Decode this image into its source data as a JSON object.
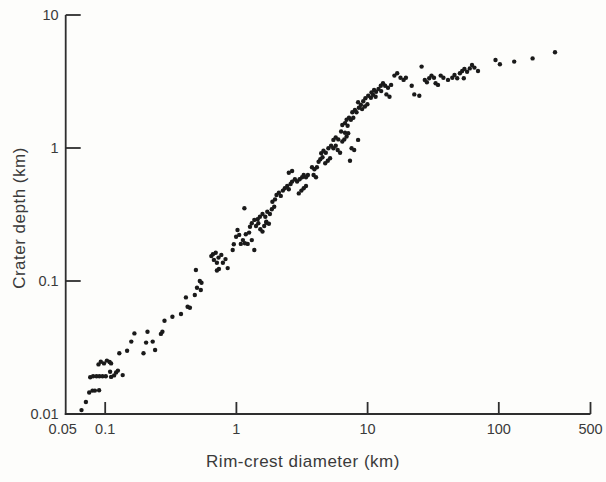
{
  "chart_data": {
    "type": "scatter",
    "title": "",
    "xlabel": "Rim-crest diameter (km)",
    "ylabel": "Crater depth (km)",
    "x_scale": "log",
    "y_scale": "log",
    "xlim": [
      0.05,
      500
    ],
    "ylim": [
      0.01,
      10
    ],
    "grid": false,
    "legend": null,
    "axis_color": "#2e2e2e",
    "label_color": "#3a3a3a",
    "x_ticks": [
      0.1,
      1,
      10,
      100,
      500
    ],
    "x_tick_labels": [
      "0.1",
      "1",
      "10",
      "100",
      "500"
    ],
    "x_edge_label": "0.05",
    "y_ticks": [
      10,
      1,
      0.1,
      0.01
    ],
    "y_tick_labels": [
      "10",
      "1",
      "0.1",
      "0.01"
    ],
    "marker": {
      "shape": "circle",
      "color": "#1a1a1a",
      "radius_px": 2.2
    },
    "points": [
      [
        0.066,
        0.0107
      ],
      [
        0.0713,
        0.0123
      ],
      [
        0.0755,
        0.0145
      ],
      [
        0.08,
        0.015
      ],
      [
        0.0834,
        0.015
      ],
      [
        0.0898,
        0.0151
      ],
      [
        0.0768,
        0.0189
      ],
      [
        0.0809,
        0.0192
      ],
      [
        0.0859,
        0.0192
      ],
      [
        0.0904,
        0.0192
      ],
      [
        0.0953,
        0.0192
      ],
      [
        0.101,
        0.0192
      ],
      [
        0.0889,
        0.0236
      ],
      [
        0.0925,
        0.0247
      ],
      [
        0.0979,
        0.024
      ],
      [
        0.103,
        0.0252
      ],
      [
        0.108,
        0.0246
      ],
      [
        0.111,
        0.024
      ],
      [
        0.109,
        0.0208
      ],
      [
        0.111,
        0.019
      ],
      [
        0.117,
        0.0195
      ],
      [
        0.121,
        0.0205
      ],
      [
        0.125,
        0.0212
      ],
      [
        0.136,
        0.0196
      ],
      [
        0.128,
        0.0286
      ],
      [
        0.147,
        0.0299
      ],
      [
        0.158,
        0.035
      ],
      [
        0.167,
        0.0404
      ],
      [
        0.196,
        0.0286
      ],
      [
        0.205,
        0.0344
      ],
      [
        0.21,
        0.0416
      ],
      [
        0.23,
        0.035
      ],
      [
        0.24,
        0.0303
      ],
      [
        0.266,
        0.04
      ],
      [
        0.273,
        0.0416
      ],
      [
        0.283,
        0.0503
      ],
      [
        0.325,
        0.0539
      ],
      [
        0.378,
        0.0565
      ],
      [
        0.425,
        0.0641
      ],
      [
        0.412,
        0.0753
      ],
      [
        0.442,
        0.063
      ],
      [
        0.482,
        0.0785
      ],
      [
        0.501,
        0.0891
      ],
      [
        0.526,
        0.1
      ],
      [
        0.542,
        0.0971
      ],
      [
        0.535,
        0.0855
      ],
      [
        0.491,
        0.121
      ],
      [
        0.644,
        0.154
      ],
      [
        0.662,
        0.159
      ],
      [
        0.695,
        0.163
      ],
      [
        0.674,
        0.144
      ],
      [
        0.71,
        0.137
      ],
      [
        0.731,
        0.15
      ],
      [
        0.767,
        0.157
      ],
      [
        0.735,
        0.123
      ],
      [
        0.71,
        0.12
      ],
      [
        0.789,
        0.137
      ],
      [
        0.826,
        0.146
      ],
      [
        0.859,
        0.125
      ],
      [
        0.938,
        0.171
      ],
      [
        0.955,
        0.189
      ],
      [
        0.995,
        0.215
      ],
      [
        1.02,
        0.242
      ],
      [
        1.05,
        0.222
      ],
      [
        1.08,
        0.19
      ],
      [
        1.12,
        0.203
      ],
      [
        1.16,
        0.192
      ],
      [
        1.18,
        0.225
      ],
      [
        1.22,
        0.19
      ],
      [
        1.25,
        0.231
      ],
      [
        1.27,
        0.256
      ],
      [
        1.31,
        0.272
      ],
      [
        1.37,
        0.288
      ],
      [
        1.41,
        0.259
      ],
      [
        1.47,
        0.272
      ],
      [
        1.52,
        0.245
      ],
      [
        1.58,
        0.235
      ],
      [
        1.63,
        0.259
      ],
      [
        1.69,
        0.274
      ],
      [
        1.31,
        0.203
      ],
      [
        1.37,
        0.171
      ],
      [
        1.15,
        0.352
      ],
      [
        1.45,
        0.291
      ],
      [
        1.51,
        0.304
      ],
      [
        1.58,
        0.319
      ],
      [
        1.66,
        0.304
      ],
      [
        1.72,
        0.332
      ],
      [
        1.8,
        0.319
      ],
      [
        1.86,
        0.346
      ],
      [
        1.94,
        0.362
      ],
      [
        1.69,
        0.279
      ],
      [
        1.77,
        0.269
      ],
      [
        1.88,
        0.395
      ],
      [
        1.97,
        0.411
      ],
      [
        2.02,
        0.443
      ],
      [
        2.11,
        0.461
      ],
      [
        2.18,
        0.436
      ],
      [
        2.26,
        0.478
      ],
      [
        2.34,
        0.498
      ],
      [
        2.44,
        0.518
      ],
      [
        2.51,
        0.489
      ],
      [
        2.59,
        0.536
      ],
      [
        2.66,
        0.559
      ],
      [
        2.79,
        0.582
      ],
      [
        2.9,
        0.559
      ],
      [
        3.03,
        0.582
      ],
      [
        3.17,
        0.603
      ],
      [
        3.26,
        0.627
      ],
      [
        3.39,
        0.603
      ],
      [
        3.51,
        0.627
      ],
      [
        2.99,
        0.456
      ],
      [
        3.13,
        0.478
      ],
      [
        3.26,
        0.498
      ],
      [
        3.39,
        0.518
      ],
      [
        2.51,
        0.652
      ],
      [
        2.66,
        0.671
      ],
      [
        3.77,
        0.716
      ],
      [
        3.93,
        0.692
      ],
      [
        4.11,
        0.716
      ],
      [
        3.88,
        0.627
      ],
      [
        4.04,
        0.603
      ],
      [
        4.23,
        0.789
      ],
      [
        4.36,
        0.822
      ],
      [
        4.53,
        0.851
      ],
      [
        4.43,
        0.912
      ],
      [
        4.61,
        0.955
      ],
      [
        4.8,
        0.922
      ],
      [
        4.75,
        0.767
      ],
      [
        4.97,
        0.803
      ],
      [
        5.18,
        0.837
      ],
      [
        5.03,
        0.995
      ],
      [
        5.27,
        1.04
      ],
      [
        5.49,
        0.995
      ],
      [
        5.71,
        1.04
      ],
      [
        5.49,
        1.15
      ],
      [
        5.71,
        1.2
      ],
      [
        5.98,
        1.16
      ],
      [
        5.92,
        0.966
      ],
      [
        6.17,
        0.922
      ],
      [
        6.42,
        1.12
      ],
      [
        6.65,
        1.16
      ],
      [
        6.92,
        1.22
      ],
      [
        7.12,
        1.29
      ],
      [
        6.73,
        1.3
      ],
      [
        6.28,
        1.33
      ],
      [
        7.55,
        0.995
      ],
      [
        7.91,
        0.966
      ],
      [
        7.34,
        0.803
      ],
      [
        8.47,
        1.15
      ],
      [
        6.42,
        1.49
      ],
      [
        6.73,
        1.54
      ],
      [
        7.04,
        1.47
      ],
      [
        6.92,
        1.63
      ],
      [
        7.21,
        1.69
      ],
      [
        7.46,
        1.63
      ],
      [
        7.78,
        1.69
      ],
      [
        7.64,
        1.86
      ],
      [
        8,
        1.93
      ],
      [
        8.23,
        1.86
      ],
      [
        8.58,
        2.01
      ],
      [
        8.89,
        2.11
      ],
      [
        8.47,
        2.21
      ],
      [
        9.08,
        1.96
      ],
      [
        9.53,
        2.05
      ],
      [
        9.96,
        2.13
      ],
      [
        9.25,
        2.25
      ],
      [
        9.62,
        2.37
      ],
      [
        10.1,
        2.47
      ],
      [
        10.6,
        2.39
      ],
      [
        11,
        2.51
      ],
      [
        11.5,
        2.43
      ],
      [
        10.7,
        2.62
      ],
      [
        11.2,
        2.73
      ],
      [
        11.6,
        2.65
      ],
      [
        12.1,
        2.78
      ],
      [
        12.7,
        2.68
      ],
      [
        12.6,
        2.94
      ],
      [
        13.1,
        3.07
      ],
      [
        13.6,
        2.94
      ],
      [
        14.3,
        2.84
      ],
      [
        15.1,
        2.98
      ],
      [
        13.9,
        2.53
      ],
      [
        14.7,
        2.43
      ],
      [
        16,
        3.5
      ],
      [
        16.8,
        3.65
      ],
      [
        17.8,
        3.38
      ],
      [
        18.8,
        3.25
      ],
      [
        19.6,
        3.38
      ],
      [
        21.7,
        2.94
      ],
      [
        22.7,
        2.53
      ],
      [
        24.8,
        2.47
      ],
      [
        25.8,
        4.09
      ],
      [
        27.3,
        3.25
      ],
      [
        28.3,
        3.12
      ],
      [
        29.5,
        3.34
      ],
      [
        30.7,
        3.5
      ],
      [
        32.1,
        3.38
      ],
      [
        33,
        3.07
      ],
      [
        34.4,
        2.98
      ],
      [
        36.1,
        3.5
      ],
      [
        37.8,
        3.38
      ],
      [
        41,
        3.25
      ],
      [
        44.2,
        3.38
      ],
      [
        46,
        3.54
      ],
      [
        48.2,
        3.34
      ],
      [
        50.5,
        3.65
      ],
      [
        52.6,
        3.79
      ],
      [
        54.7,
        3.93
      ],
      [
        57.3,
        3.75
      ],
      [
        60.1,
        3.97
      ],
      [
        62.5,
        4.21
      ],
      [
        65.2,
        4.02
      ],
      [
        54.1,
        3.34
      ],
      [
        69.4,
        3.79
      ],
      [
        94.4,
        4.59
      ],
      [
        102,
        4.26
      ],
      [
        131,
        4.46
      ],
      [
        181,
        4.72
      ],
      [
        268,
        5.24
      ]
    ]
  }
}
